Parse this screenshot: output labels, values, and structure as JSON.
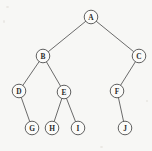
{
  "diagram": {
    "type": "binary-tree",
    "background_color": "#f7f7f5",
    "node_fill_color": "#fbfbf9",
    "node_stroke_color": "#4f4f4f",
    "edge_color": "#5a5a5a",
    "label_color": "#2b2b2b",
    "node_radius": 6.8,
    "canvas": {
      "width": 152,
      "height": 151
    },
    "nodes": [
      {
        "id": "A",
        "label": "A",
        "x": 91,
        "y": 17,
        "depth": 0
      },
      {
        "id": "B",
        "label": "B",
        "x": 43,
        "y": 56,
        "depth": 1
      },
      {
        "id": "C",
        "label": "C",
        "x": 139,
        "y": 56,
        "depth": 1
      },
      {
        "id": "D",
        "label": "D",
        "x": 19,
        "y": 91,
        "depth": 2
      },
      {
        "id": "E",
        "label": "E",
        "x": 64,
        "y": 92,
        "depth": 2
      },
      {
        "id": "F",
        "label": "F",
        "x": 117,
        "y": 91,
        "depth": 2
      },
      {
        "id": "G",
        "label": "G",
        "x": 32,
        "y": 128,
        "depth": 3
      },
      {
        "id": "H",
        "label": "H",
        "x": 52,
        "y": 128,
        "depth": 3
      },
      {
        "id": "I",
        "label": "I",
        "x": 78,
        "y": 128,
        "depth": 3
      },
      {
        "id": "J",
        "label": "J",
        "x": 125,
        "y": 128,
        "depth": 3
      }
    ],
    "edges": [
      {
        "from": "A",
        "to": "B",
        "side": "left"
      },
      {
        "from": "A",
        "to": "C",
        "side": "right"
      },
      {
        "from": "B",
        "to": "D",
        "side": "left"
      },
      {
        "from": "B",
        "to": "E",
        "side": "right"
      },
      {
        "from": "C",
        "to": "F",
        "side": "left"
      },
      {
        "from": "D",
        "to": "G",
        "side": "right"
      },
      {
        "from": "E",
        "to": "H",
        "side": "left"
      },
      {
        "from": "E",
        "to": "I",
        "side": "right"
      },
      {
        "from": "F",
        "to": "J",
        "side": "right"
      }
    ],
    "root": "A",
    "leaves": [
      "G",
      "H",
      "I",
      "J"
    ]
  }
}
